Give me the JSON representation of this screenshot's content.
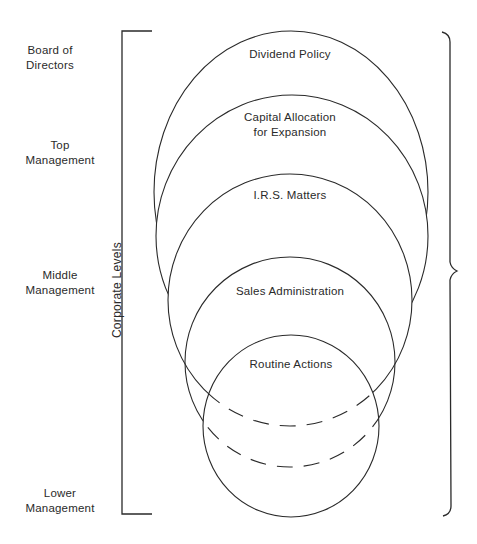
{
  "diagram": {
    "axis_title": "Corporate Levels",
    "levels": [
      {
        "label_line1": "Board of",
        "label_line2": "Directors"
      },
      {
        "label_line1": "Top",
        "label_line2": "Management"
      },
      {
        "label_line1": "Middle",
        "label_line2": "Management"
      },
      {
        "label_line1": "Lower",
        "label_line2": "Management"
      }
    ],
    "decisions": [
      {
        "label_line1": "Dividend Policy",
        "label_line2": ""
      },
      {
        "label_line1": "Capital Allocation",
        "label_line2": "for Expansion"
      },
      {
        "label_line1": "I.R.S. Matters",
        "label_line2": ""
      },
      {
        "label_line1": "Sales Administration",
        "label_line2": ""
      },
      {
        "label_line1": "Routine Actions",
        "label_line2": ""
      }
    ],
    "line_color": "#2a2a2a"
  }
}
